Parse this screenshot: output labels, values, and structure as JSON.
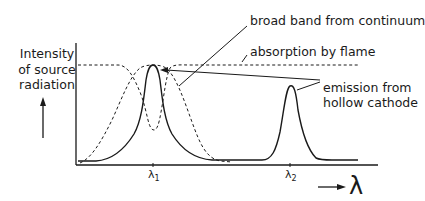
{
  "figure": {
    "type": "spectral-diagram",
    "y_axis_label_lines": [
      "Intensity",
      "of source",
      "radiation"
    ],
    "x_axis_symbol": "λ",
    "ticks": [
      {
        "symbol": "λ",
        "subscript": "1"
      },
      {
        "symbol": "λ",
        "subscript": "2"
      }
    ],
    "annotations": {
      "broad_band": "broad band from continuum",
      "absorption": "absorption by flame",
      "emission_line1": "emission from",
      "emission_line2": "hollow cathode"
    },
    "curves": [
      {
        "name": "emission from hollow cathode",
        "style": "solid",
        "peaks_at": [
          "λ1",
          "λ2"
        ]
      },
      {
        "name": "broad band from continuum",
        "style": "dashed",
        "note": "flat top with absorption dip at λ1"
      },
      {
        "name": "absorption by flame",
        "style": "dashed",
        "note": "broad absorption centered at λ1"
      }
    ],
    "colors": {
      "line": "#1a1a1a",
      "background": "#ffffff"
    }
  }
}
